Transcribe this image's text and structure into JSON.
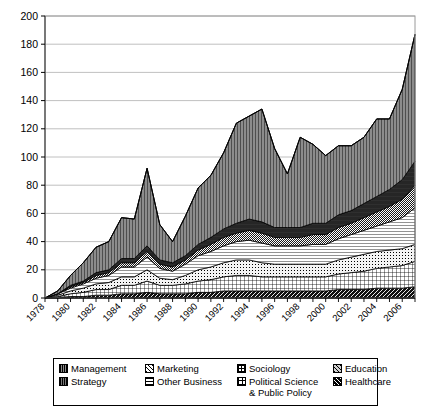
{
  "chart_data": {
    "type": "area",
    "stacked": true,
    "title": "",
    "xlabel": "",
    "ylabel": "",
    "ylim": [
      0,
      200
    ],
    "ytick_step": 20,
    "ytick_labels": [
      "0",
      "20",
      "40",
      "60",
      "80",
      "100",
      "120",
      "140",
      "160",
      "180",
      "200"
    ],
    "grid": true,
    "grid_axis": "y",
    "legend_position": "bottom",
    "x": [
      1978,
      1979,
      1980,
      1981,
      1982,
      1983,
      1984,
      1985,
      1986,
      1987,
      1988,
      1989,
      1990,
      1991,
      1992,
      1993,
      1994,
      1995,
      1996,
      1997,
      1998,
      1999,
      2000,
      2001,
      2002,
      2003,
      2004,
      2005,
      2006,
      2007
    ],
    "xtick_labels": [
      "1978",
      "1980",
      "1982",
      "1984",
      "1986",
      "1988",
      "1990",
      "1992",
      "1994",
      "1996",
      "1998",
      "2000",
      "2002",
      "2004",
      "2006"
    ],
    "xtick_interval": 2,
    "series": [
      {
        "name": "Healthcare",
        "pattern": "dark-diagonal",
        "color": "#111111",
        "values": [
          0,
          0,
          1,
          1,
          2,
          2,
          3,
          3,
          4,
          3,
          3,
          3,
          4,
          4,
          5,
          5,
          5,
          5,
          5,
          5,
          5,
          5,
          5,
          6,
          6,
          6,
          7,
          7,
          7,
          8
        ]
      },
      {
        "name": "Political Science & Public Policy",
        "pattern": "grid-crosshatch",
        "color": "#ffffff",
        "values": [
          0,
          1,
          2,
          3,
          4,
          4,
          6,
          6,
          8,
          6,
          6,
          7,
          8,
          9,
          10,
          11,
          11,
          10,
          10,
          10,
          10,
          10,
          10,
          11,
          12,
          13,
          14,
          15,
          16,
          18
        ]
      },
      {
        "name": "Sociology",
        "pattern": "fine-dot-grid",
        "color": "#f2f2f2",
        "values": [
          0,
          1,
          2,
          3,
          4,
          5,
          6,
          6,
          8,
          5,
          4,
          6,
          8,
          9,
          10,
          11,
          11,
          10,
          9,
          9,
          9,
          9,
          9,
          10,
          11,
          12,
          12,
          12,
          12,
          12
        ]
      },
      {
        "name": "Other Business",
        "pattern": "horizontal-lines",
        "color": "#ffffff",
        "values": [
          0,
          1,
          2,
          3,
          4,
          5,
          7,
          7,
          9,
          7,
          6,
          8,
          10,
          11,
          12,
          13,
          14,
          14,
          13,
          13,
          13,
          14,
          14,
          15,
          16,
          17,
          18,
          20,
          22,
          26
        ]
      },
      {
        "name": "Marketing",
        "pattern": "diagonal-hatch",
        "color": "#ffffff",
        "values": [
          0,
          0,
          1,
          1,
          2,
          2,
          3,
          3,
          4,
          3,
          3,
          3,
          4,
          5,
          6,
          6,
          7,
          7,
          6,
          6,
          6,
          7,
          7,
          8,
          8,
          9,
          10,
          11,
          13,
          16
        ]
      },
      {
        "name": "Strategy",
        "pattern": "solid-dark",
        "color": "#2b2b2b",
        "values": [
          0,
          0,
          1,
          1,
          2,
          2,
          3,
          3,
          4,
          3,
          3,
          3,
          4,
          5,
          6,
          7,
          8,
          8,
          7,
          7,
          7,
          8,
          8,
          9,
          9,
          10,
          11,
          12,
          14,
          17
        ]
      },
      {
        "name": "Management",
        "pattern": "vertical-lines",
        "color": "#7a7a7a",
        "values": [
          0,
          2,
          7,
          13,
          18,
          20,
          29,
          28,
          55,
          25,
          15,
          28,
          40,
          44,
          54,
          71,
          73,
          80,
          56,
          38,
          64,
          56,
          48,
          49,
          46,
          47,
          55,
          50,
          64,
          90
        ]
      },
      {
        "name": "Education",
        "pattern": "diagonal-hatch-gray",
        "color": "#c8c8c8",
        "values": [
          0,
          0,
          0,
          0,
          0,
          0,
          0,
          0,
          0,
          0,
          0,
          0,
          0,
          0,
          0,
          0,
          0,
          0,
          0,
          0,
          0,
          0,
          0,
          0,
          0,
          0,
          0,
          0,
          0,
          0
        ]
      }
    ],
    "totals": [
      0,
      5,
      15,
      25,
      36,
      40,
      57,
      56,
      92,
      52,
      40,
      58,
      78,
      87,
      103,
      124,
      129,
      134,
      106,
      88,
      114,
      109,
      101,
      108,
      108,
      114,
      127,
      127,
      148,
      187
    ],
    "peak": {
      "year": 2007,
      "value": 187
    }
  },
  "legend": {
    "items": [
      {
        "label": "Management",
        "swatch": "sw-management"
      },
      {
        "label": "Marketing",
        "swatch": "sw-marketing"
      },
      {
        "label": "Sociology",
        "swatch": "sw-sociology"
      },
      {
        "label": "Education",
        "swatch": "sw-education"
      },
      {
        "label": "Strategy",
        "swatch": "sw-strategy"
      },
      {
        "label": "Other Business",
        "swatch": "sw-otherbusiness"
      },
      {
        "label": "Political Science\n& Public Policy",
        "swatch": "sw-polisci"
      },
      {
        "label": "Healthcare",
        "swatch": "sw-healthcare"
      }
    ]
  }
}
